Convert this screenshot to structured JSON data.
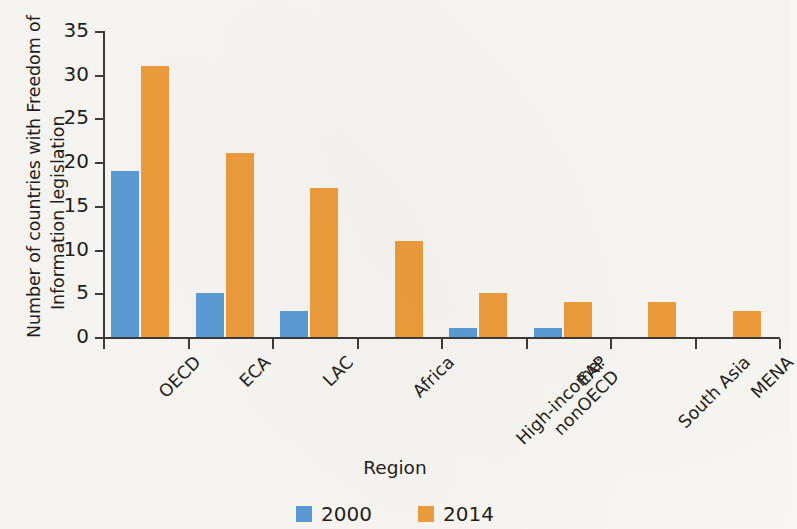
{
  "chart_data": {
    "type": "bar",
    "title": "",
    "xlabel": "Region",
    "ylabel_line1": "Number of countries with Freedom of",
    "ylabel_line2": "Information legislation",
    "ylabel": "Number of countries with Freedom of Information legislation",
    "categories": [
      "OECD",
      "ECA",
      "LAC",
      "Africa",
      "High-income:\nnonOECD",
      "EAP",
      "South Asia",
      "MENA"
    ],
    "category_lines": [
      [
        "OECD"
      ],
      [
        "ECA"
      ],
      [
        "LAC"
      ],
      [
        "Africa"
      ],
      [
        "High-income:",
        "nonOECD"
      ],
      [
        "EAP"
      ],
      [
        "South Asia"
      ],
      [
        "MENA"
      ]
    ],
    "series": [
      {
        "name": "2000",
        "color": "#5b9bd5",
        "values": [
          19,
          5,
          3,
          0,
          1,
          1,
          0,
          0
        ]
      },
      {
        "name": "2014",
        "color": "#ed9c3c",
        "values": [
          31,
          21,
          17,
          11,
          5,
          4,
          4,
          3
        ]
      }
    ],
    "ylim": [
      0,
      35
    ],
    "yticks": [
      0,
      5,
      10,
      15,
      20,
      25,
      30,
      35
    ],
    "ytick_labels": [
      "0",
      "5",
      "10",
      "15",
      "20",
      "25",
      "30",
      "35"
    ],
    "grid": false,
    "legend_position": "bottom-center",
    "background_color": "#f8f6f2",
    "axis_color": "#3b3b3b"
  }
}
